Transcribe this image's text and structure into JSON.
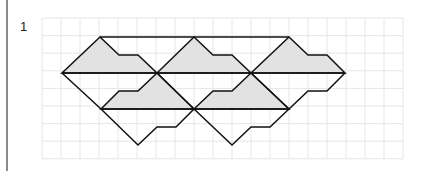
{
  "problem": {
    "number": "1"
  },
  "figure": {
    "grid": {
      "x0": 42,
      "y0": 18,
      "cols": 19,
      "rows": 8,
      "dx": 19,
      "dy": 17.6,
      "color": "#e6e6e6"
    },
    "fill_color": "#e2e2e2",
    "stroke_color": "#111111",
    "shaded_shapes": [
      "62,73 100,37 119,55 138,55 157,73",
      "157,73 194,37 213,55 232,55 251,73",
      "251,73 289,37 308,55 327,55 345,73",
      "101,109 119,91 138,91 157,73 194,109",
      "194,109 213,91 232,91 251,73 289,109"
    ],
    "lines": [
      "100,37 289,37",
      "62,73 345,73",
      "101,109 289,109",
      "62,73 101,109 138,145 157,127 176,127 194,109 232,145 251,127 270,127 289,109 308,91 327,91 345,73",
      "157,73 194,109",
      "251,73 289,109"
    ]
  }
}
